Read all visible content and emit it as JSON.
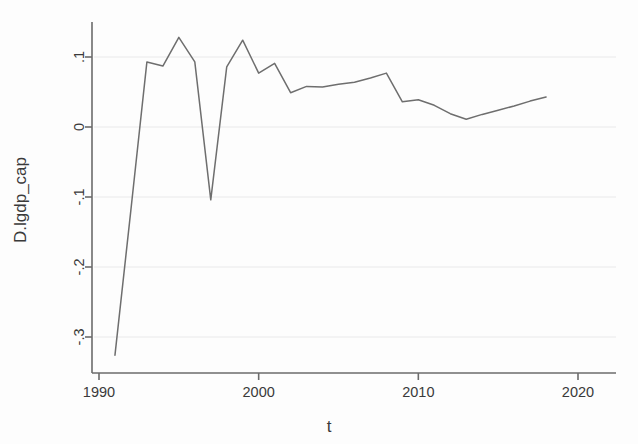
{
  "chart_data": {
    "type": "line",
    "title": "",
    "subtitle": "",
    "xlabel": "t",
    "ylabel": "D.lgdp_cap",
    "xlim": [
      1990,
      2020
    ],
    "ylim": [
      -0.34,
      0.145
    ],
    "xticks": [
      1990,
      2000,
      2010,
      2020
    ],
    "xtick_labels": [
      "1990",
      "2000",
      "2010",
      "2020"
    ],
    "yticks": [
      -0.3,
      -0.2,
      -0.1,
      0,
      0.1
    ],
    "ytick_labels": [
      "-.3",
      "-.2",
      "-.1",
      "0",
      ".1"
    ],
    "grid": true,
    "grid_axis": "y",
    "legend": false,
    "legend_position": "none",
    "line_color": "#6e6e6e",
    "grid_color": "#e9e9ea",
    "axis_color": "#6b6b6b",
    "background_color": "#fdfdfd",
    "series": [
      {
        "name": "D.lgdp_cap",
        "x": [
          1991,
          1992,
          1993,
          1994,
          1995,
          1996,
          1997,
          1998,
          1999,
          2000,
          2001,
          2002,
          2003,
          2004,
          2005,
          2006,
          2007,
          2008,
          2009,
          2010,
          2011,
          2012,
          2013,
          2014,
          2015,
          2016,
          2017,
          2018
        ],
        "values": [
          -0.326,
          -0.118,
          0.093,
          0.087,
          0.128,
          0.093,
          -0.104,
          0.086,
          0.124,
          0.077,
          0.091,
          0.049,
          0.058,
          0.057,
          0.061,
          0.064,
          0.07,
          0.077,
          0.036,
          0.039,
          0.031,
          0.019,
          0.011,
          0.018,
          0.024,
          0.03,
          0.037,
          0.043
        ]
      }
    ]
  }
}
